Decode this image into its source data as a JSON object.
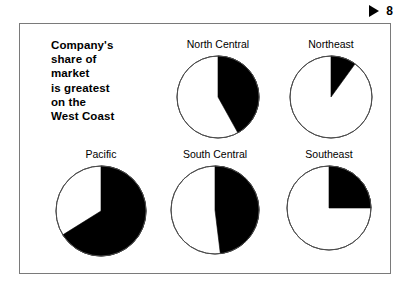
{
  "header": {
    "play_icon": "play-triangle-icon",
    "slide_number": "8"
  },
  "slide": {
    "headline_lines": [
      "Company's",
      "share of",
      "market",
      "is greatest",
      "on the",
      "West Coast"
    ]
  },
  "colors": {
    "slice_fill": "#000000",
    "slice_empty": "#ffffff",
    "outline": "#4d4d4d",
    "frame_border": "#7a7a7a",
    "background": "#ffffff",
    "text": "#000000"
  },
  "chart_data": {
    "type": "pie",
    "title": "Company's share of market is greatest on the West Coast",
    "legend": "none",
    "series_name": "Company share of market",
    "units": "percent",
    "start_angle_deg": 0,
    "direction": "clockwise",
    "charts": [
      {
        "title": "North Central",
        "labels": [
          "Company share",
          "Other"
        ],
        "values": [
          42,
          58
        ],
        "share_pct": 42,
        "sweep_deg": 151
      },
      {
        "title": "Northeast",
        "labels": [
          "Company share",
          "Other"
        ],
        "values": [
          10,
          90
        ],
        "share_pct": 10,
        "sweep_deg": 36
      },
      {
        "title": "Pacific",
        "labels": [
          "Company share",
          "Other"
        ],
        "values": [
          66,
          34
        ],
        "share_pct": 66,
        "sweep_deg": 238
      },
      {
        "title": "South Central",
        "labels": [
          "Company share",
          "Other"
        ],
        "values": [
          48,
          52
        ],
        "share_pct": 48,
        "sweep_deg": 173
      },
      {
        "title": "Southeast",
        "labels": [
          "Company share",
          "Other"
        ],
        "values": [
          25,
          75
        ],
        "share_pct": 25,
        "sweep_deg": 90
      }
    ]
  },
  "pies": {
    "north_central": {
      "title": "North Central",
      "radius": 41
    },
    "northeast": {
      "title": "Northeast",
      "radius": 41
    },
    "pacific": {
      "title": "Pacific",
      "radius": 45
    },
    "south_central": {
      "title": "South Central",
      "radius": 44
    },
    "southeast": {
      "title": "Southeast",
      "radius": 42
    }
  }
}
